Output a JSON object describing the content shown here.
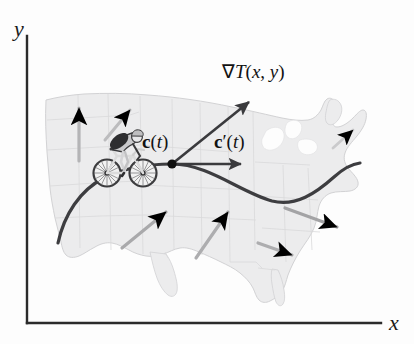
{
  "figure": {
    "background_color": "#fdfdfd"
  },
  "axes": {
    "x_label": "x",
    "y_label": "y",
    "axis_color": "#2b2b2b",
    "origin_px": [
      27,
      323
    ],
    "x_axis_end_px": [
      381,
      323
    ],
    "y_axis_top_px": [
      27,
      36
    ]
  },
  "map": {
    "name": "united-states-outline",
    "fill_color": "#ececed",
    "border_color": "#d3d3d5",
    "state_line_color": "#d8d8da"
  },
  "curve": {
    "name": "bicycle-path-curve",
    "color": "#3d3d40",
    "width_px": 3.2,
    "start_px": [
      58,
      243
    ],
    "end_px": [
      360,
      163
    ]
  },
  "point": {
    "label": "c(t)",
    "label_plain": "c(t)",
    "position_px": [
      172,
      164
    ],
    "color": "#101010",
    "radius_px": 4.5
  },
  "vectors": [
    {
      "name": "gradient-vector",
      "label": "∇T(x, y)",
      "from_px": [
        172,
        164
      ],
      "to_px": [
        252,
        99
      ],
      "color": "#3a3a3d",
      "label_px": [
        222,
        62
      ]
    },
    {
      "name": "velocity-vector",
      "label": "c′(t)",
      "from_px": [
        172,
        164
      ],
      "to_px": [
        246,
        164
      ],
      "color": "#3a3a3d",
      "label_px": [
        218,
        133
      ]
    }
  ],
  "field_arrows": [
    {
      "name": "field-arrow-northwest-vertical",
      "from_px": [
        79,
        161
      ],
      "to_px": [
        79,
        108
      ],
      "color": "#b4b4b6"
    },
    {
      "name": "field-arrow-northern-rockies",
      "from_px": [
        105,
        140
      ],
      "to_px": [
        130,
        110
      ],
      "color": "#bcbcbe"
    },
    {
      "name": "field-arrow-plains-left",
      "from_px": [
        122,
        248
      ],
      "to_px": [
        166,
        212
      ],
      "color": "#a9a9ab"
    },
    {
      "name": "field-arrow-plains-right",
      "from_px": [
        196,
        258
      ],
      "to_px": [
        228,
        212
      ],
      "color": "#adadaf"
    },
    {
      "name": "field-arrow-midwest-east",
      "from_px": [
        285,
        208
      ],
      "to_px": [
        337,
        227
      ],
      "color": "#a3a3a5"
    },
    {
      "name": "field-arrow-southeast",
      "from_px": [
        258,
        243
      ],
      "to_px": [
        292,
        255
      ],
      "color": "#adadaf"
    },
    {
      "name": "field-arrow-northeast",
      "from_px": [
        333,
        148
      ],
      "to_px": [
        353,
        130
      ],
      "color": "#cacacc"
    }
  ],
  "cyclist": {
    "name": "cyclist-on-bicycle",
    "position_px": [
      93,
      128
    ],
    "size_px": [
      64,
      62
    ],
    "frame_color": "#dedede",
    "wheel_color": "#3c3c3e",
    "rider_color": "#2e2e30",
    "helmet_color": "#cfcfd1"
  }
}
